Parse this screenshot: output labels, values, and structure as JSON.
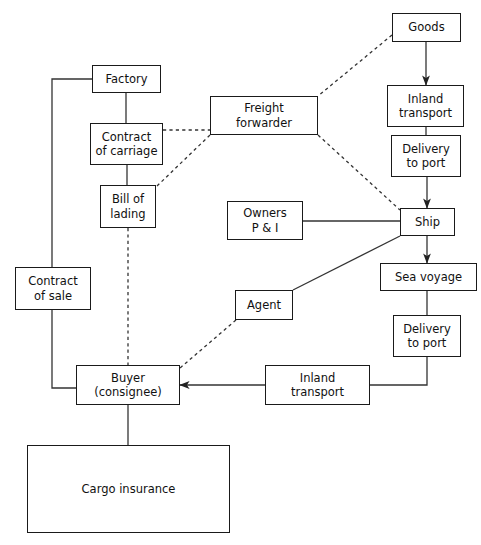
{
  "diagram": {
    "canvas": {
      "width": 481,
      "height": 545
    },
    "style": {
      "background": "#ffffff",
      "box_border_color": "#1a1a1a",
      "line_color": "#333333",
      "text_color": "#111111"
    },
    "nodes": [
      {
        "id": "goods",
        "label": "Goods",
        "x": 392,
        "y": 13,
        "w": 69,
        "h": 29
      },
      {
        "id": "inland_top",
        "label": "Inland\ntransport",
        "x": 387,
        "y": 85,
        "w": 77,
        "h": 42
      },
      {
        "id": "delivery_top",
        "label": "Delivery\nto port",
        "x": 391,
        "y": 135,
        "w": 70,
        "h": 42
      },
      {
        "id": "ship",
        "label": "Ship",
        "x": 400,
        "y": 208,
        "w": 55,
        "h": 28
      },
      {
        "id": "sea_voyage",
        "label": "Sea voyage",
        "x": 380,
        "y": 263,
        "w": 97,
        "h": 28
      },
      {
        "id": "delivery_bottom",
        "label": "Delivery\nto port",
        "x": 393,
        "y": 315,
        "w": 68,
        "h": 42
      },
      {
        "id": "factory",
        "label": "Factory",
        "x": 92,
        "y": 65,
        "w": 69,
        "h": 28
      },
      {
        "id": "contract_carriage",
        "label": "Contract\nof carriage",
        "x": 90,
        "y": 123,
        "w": 73,
        "h": 42
      },
      {
        "id": "bill_of_lading",
        "label": "Bill of\nlading",
        "x": 100,
        "y": 185,
        "w": 56,
        "h": 43
      },
      {
        "id": "contract_of_sale",
        "label": "Contract\nof sale",
        "x": 15,
        "y": 267,
        "w": 76,
        "h": 43
      },
      {
        "id": "freight_forwarder",
        "label": "Freight\nforwarder",
        "x": 210,
        "y": 96,
        "w": 108,
        "h": 39
      },
      {
        "id": "owners_pandi",
        "label": "Owners\nP & I",
        "x": 227,
        "y": 201,
        "w": 76,
        "h": 39
      },
      {
        "id": "agent",
        "label": "Agent",
        "x": 235,
        "y": 290,
        "w": 58,
        "h": 30
      },
      {
        "id": "buyer",
        "label": "Buyer\n(consignee)",
        "x": 76,
        "y": 365,
        "w": 104,
        "h": 40
      },
      {
        "id": "inland_bottom",
        "label": "Inland\ntransport",
        "x": 265,
        "y": 365,
        "w": 105,
        "h": 40
      },
      {
        "id": "cargo_insurance",
        "label": "Cargo insurance",
        "x": 27,
        "y": 445,
        "w": 203,
        "h": 88
      }
    ],
    "edges": [
      {
        "id": "goods-to-inland",
        "from": "goods",
        "to": "inland_top",
        "style": "solid",
        "arrow": true,
        "points": "426,42 426,85"
      },
      {
        "id": "inland-to-delivery",
        "from": "inland_top",
        "to": "delivery_top",
        "style": "solid",
        "arrow": false,
        "points": "426,127 426,135"
      },
      {
        "id": "delivery-to-ship",
        "from": "delivery_top",
        "to": "ship",
        "style": "solid",
        "arrow": true,
        "points": "427,177 427,208"
      },
      {
        "id": "ship-to-sea-voyage",
        "from": "ship",
        "to": "sea_voyage",
        "style": "solid",
        "arrow": true,
        "points": "427,236 427,263"
      },
      {
        "id": "sea-voyage-to-delivery",
        "from": "sea_voyage",
        "to": "delivery_bottom",
        "style": "solid",
        "arrow": false,
        "points": "427,291 427,315"
      },
      {
        "id": "delivery-to-inland-bottom",
        "from": "delivery_bottom",
        "to": "inland_bottom",
        "style": "solid",
        "arrow": false,
        "points": "427,357 427,385 370,385"
      },
      {
        "id": "inland-bottom-to-buyer",
        "from": "inland_bottom",
        "to": "buyer",
        "style": "solid",
        "arrow": true,
        "points": "265,385 180,385"
      },
      {
        "id": "factory-to-contract",
        "from": "factory",
        "to": "contract_carriage",
        "style": "solid",
        "arrow": false,
        "points": "126,93 126,123"
      },
      {
        "id": "contract-to-bill",
        "from": "contract_carriage",
        "to": "bill_of_lading",
        "style": "solid",
        "arrow": false,
        "points": "127,165 127,185"
      },
      {
        "id": "factory-to-buyer-left",
        "from": "factory",
        "to": "buyer",
        "style": "solid",
        "arrow": false,
        "points": "92,79 52,79 52,388 76,388"
      },
      {
        "id": "bill-to-buyer",
        "from": "bill_of_lading",
        "to": "buyer",
        "style": "dashed",
        "arrow": false,
        "points": "128,228 128,365"
      },
      {
        "id": "buyer-to-cargo-insurance",
        "from": "buyer",
        "to": "cargo_insurance",
        "style": "solid",
        "arrow": false,
        "points": "128,405 128,445"
      },
      {
        "id": "goods-to-freight-forwarder",
        "from": "goods",
        "to": "freight_forwarder",
        "style": "dashed",
        "arrow": false,
        "points": "392,35 318,96"
      },
      {
        "id": "carriage-to-forwarder",
        "from": "contract_carriage",
        "to": "freight_forwarder",
        "style": "dashed",
        "arrow": false,
        "points": "163,130 210,130"
      },
      {
        "id": "forwarder-to-bill",
        "from": "freight_forwarder",
        "to": "bill_of_lading",
        "style": "dashed",
        "arrow": false,
        "points": "210,135 156,187"
      },
      {
        "id": "forwarder-to-ship",
        "from": "freight_forwarder",
        "to": "ship",
        "style": "dashed",
        "arrow": false,
        "points": "318,135 400,210"
      },
      {
        "id": "owners-to-ship",
        "from": "owners_pandi",
        "to": "ship",
        "style": "solid",
        "arrow": false,
        "points": "303,221 400,221"
      },
      {
        "id": "agent-to-ship",
        "from": "agent",
        "to": "ship",
        "style": "solid",
        "arrow": false,
        "points": "293,290 400,236"
      },
      {
        "id": "agent-to-buyer",
        "from": "agent",
        "to": "buyer",
        "style": "dashed",
        "arrow": false,
        "points": "236,320 180,368"
      }
    ]
  }
}
